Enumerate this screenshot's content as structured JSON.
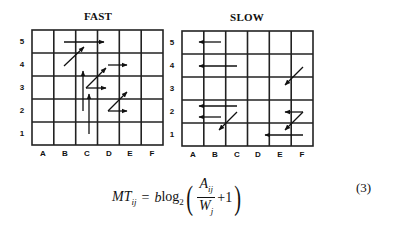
{
  "figure": {
    "panels": [
      {
        "title": "FAST",
        "columns": [
          "A",
          "B",
          "C",
          "D",
          "E",
          "F"
        ],
        "rows": [
          "5",
          "4",
          "3",
          "2",
          "1"
        ],
        "grid": {
          "left": 32,
          "top": 30,
          "right": 163,
          "bottom": 145
        },
        "arrows": [
          {
            "from": [
              "B",
              5.0
            ],
            "to": [
              "D",
              5.0
            ]
          },
          {
            "from": [
              "B",
              4.0
            ],
            "to": [
              "C",
              4.8
            ]
          },
          {
            "from": [
              "D",
              4.0
            ],
            "to": [
              "E",
              4.0
            ]
          },
          {
            "from": [
              "C",
              2.5
            ],
            "to": [
              "C",
              3.6
            ]
          },
          {
            "from": [
              "C",
              3.0
            ],
            "to": [
              "D",
              3.8
            ]
          },
          {
            "from": [
              "C",
              3.1
            ],
            "to": [
              "D",
              3.0
            ]
          },
          {
            "from": [
              "C",
              1.0
            ],
            "to": [
              "C",
              2.6
            ]
          },
          {
            "from": [
              "D",
              2.1
            ],
            "to": [
              "E",
              2.8
            ]
          },
          {
            "from": [
              "D",
              2.2
            ],
            "to": [
              "E",
              2.0
            ]
          }
        ]
      },
      {
        "title": "SLOW",
        "columns": [
          "A",
          "B",
          "C",
          "D",
          "E",
          "F"
        ],
        "rows": [
          "5",
          "4",
          "3",
          "2",
          "1"
        ],
        "grid": {
          "left": 182,
          "top": 31,
          "right": 313,
          "bottom": 146
        },
        "arrows": [
          {
            "from": [
              "B",
              5.0
            ],
            "to": [
              "B",
              5.0
            ],
            "note": "short left arrow at B5"
          },
          {
            "from": [
              "C",
              4.0
            ],
            "to": [
              "B",
              4.0
            ]
          },
          {
            "from": [
              "F",
              3.5
            ],
            "to": [
              "E",
              2.8
            ]
          },
          {
            "from": [
              "C",
              2.4
            ],
            "to": [
              "B",
              2.4
            ]
          },
          {
            "from": [
              "B",
              1.9
            ],
            "to": [
              "B",
              1.9
            ],
            "note": "short left arrow at B2"
          },
          {
            "from": [
              "C",
              2.2
            ],
            "to": [
              "B",
              1.3
            ]
          },
          {
            "from": [
              "F",
              2.2
            ],
            "to": [
              "E",
              2.2
            ]
          },
          {
            "from": [
              "F",
              2.2
            ],
            "to": [
              "E",
              1.4
            ]
          },
          {
            "from": [
              "F",
              1.1
            ],
            "to": [
              "E",
              1.1
            ]
          }
        ]
      }
    ]
  },
  "equation": {
    "lhs": "MT",
    "lhs_sub": "ij",
    "equals": "=",
    "coef": "b",
    "log": "log",
    "log_base": "2",
    "numerator": "A",
    "numerator_sub": "ij",
    "denominator": "W",
    "denominator_sub": "j",
    "plus": "+1",
    "number": "(3)"
  }
}
